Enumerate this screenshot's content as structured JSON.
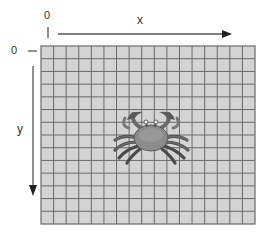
{
  "diagram": {
    "title": "",
    "x_axis": {
      "label": "x",
      "origin_label": "0",
      "direction": "right"
    },
    "y_axis": {
      "label": "y",
      "origin_label": "0",
      "direction": "down"
    },
    "grid": {
      "columns": 17,
      "rows": 14,
      "cell_fill": "#d4d4d4",
      "line_color": "#6a6a6a"
    },
    "sprite": {
      "name": "crab",
      "fill": "#8c8c8c",
      "dark": "#4a4a4a"
    }
  }
}
